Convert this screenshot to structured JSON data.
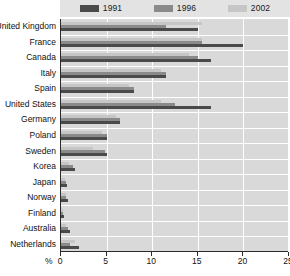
{
  "chart_data": {
    "type": "bar",
    "orientation": "horizontal",
    "title": "",
    "xlabel": "%",
    "ylabel": "",
    "xlim": [
      0,
      25
    ],
    "xticks": [
      0,
      5,
      10,
      15,
      20,
      25
    ],
    "grid": true,
    "legend_position": "top",
    "categories": [
      "United Kingdom",
      "France",
      "Canada",
      "Italy",
      "Spain",
      "United States",
      "Germany",
      "Poland",
      "Sweden",
      "Korea",
      "Japan",
      "Norway",
      "Finland",
      "Australia",
      "Netherlands"
    ],
    "series": [
      {
        "name": "1991",
        "color": "#4a4a4a",
        "values": [
          15.0,
          20.0,
          16.5,
          11.5,
          8.0,
          16.5,
          6.5,
          5.0,
          5.0,
          1.5,
          0.7,
          0.8,
          0.3,
          1.0,
          2.0
        ]
      },
      {
        "name": "1996",
        "color": "#8a8a8a",
        "values": [
          11.5,
          15.5,
          15.0,
          11.5,
          8.0,
          12.5,
          6.5,
          5.0,
          4.8,
          1.3,
          0.5,
          0.6,
          0.2,
          0.8,
          1.0
        ]
      },
      {
        "name": "2002",
        "color": "#c6c6c6",
        "values": [
          15.5,
          15.5,
          14.0,
          11.0,
          7.5,
          11.0,
          6.0,
          4.5,
          3.5,
          0.9,
          0.4,
          0.5,
          0.2,
          0.6,
          1.5
        ]
      }
    ]
  },
  "legend": {
    "items": [
      {
        "label": "1991",
        "swatch": "legend-swatch-1991"
      },
      {
        "label": "1996",
        "swatch": "legend-swatch-1996"
      },
      {
        "label": "2002",
        "swatch": "legend-swatch-2002"
      }
    ]
  },
  "axis": {
    "unit": "%"
  }
}
